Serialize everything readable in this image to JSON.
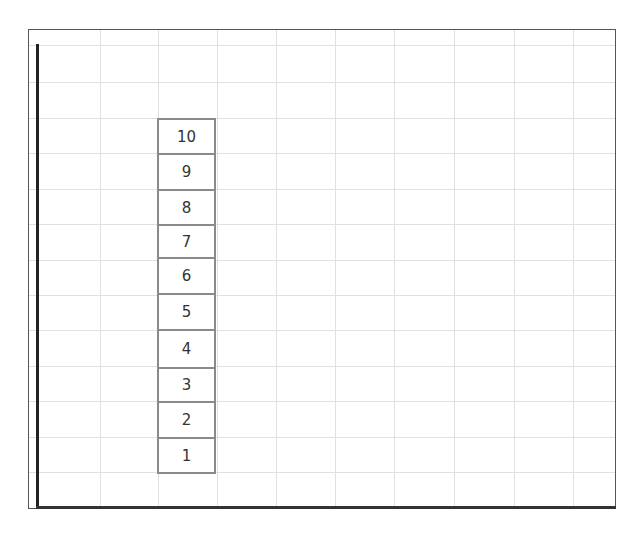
{
  "diagram": {
    "type": "stacked-numbered-boxes-on-grid",
    "grid": {
      "vertical_lines_x": [
        100,
        158,
        217,
        276,
        335,
        394,
        454,
        514,
        573
      ],
      "horizontal_lines_y": [
        45,
        82,
        118,
        153,
        189,
        224,
        260,
        295,
        330,
        366,
        401,
        437,
        472
      ]
    },
    "boxes": [
      {
        "label": "10",
        "top": 118,
        "bottom": 153
      },
      {
        "label": "9",
        "top": 153,
        "bottom": 189
      },
      {
        "label": "8",
        "top": 189,
        "bottom": 224
      },
      {
        "label": "7",
        "top": 224,
        "bottom": 257
      },
      {
        "label": "6",
        "top": 257,
        "bottom": 293
      },
      {
        "label": "5",
        "top": 293,
        "bottom": 329
      },
      {
        "label": "4",
        "top": 329,
        "bottom": 367
      },
      {
        "label": "3",
        "top": 367,
        "bottom": 401
      },
      {
        "label": "2",
        "top": 401,
        "bottom": 437
      },
      {
        "label": "1",
        "top": 437,
        "bottom": 472
      }
    ],
    "colors": {
      "grid": "#e0e0e0",
      "box_border": "#8a8a8a",
      "axis": "#222222"
    }
  }
}
